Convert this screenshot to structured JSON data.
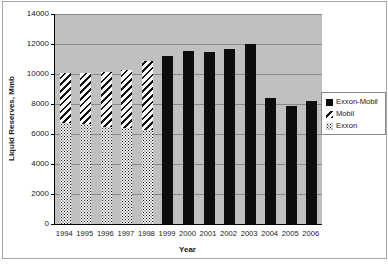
{
  "chart_data": {
    "type": "bar",
    "subtype": "stacked-and-single",
    "title": "",
    "xlabel": "Year",
    "ylabel": "Liquid Reserves, Mmb",
    "ylim": [
      0,
      14000
    ],
    "ytick_step": 2000,
    "yticks": [
      0,
      2000,
      4000,
      6000,
      8000,
      10000,
      12000,
      14000
    ],
    "grid": true,
    "plot_background": "#c0c0c0",
    "gridline_color": "#898989",
    "categories": [
      "1994",
      "1995",
      "1996",
      "1997",
      "1998",
      "1999",
      "2000",
      "2001",
      "2002",
      "2003",
      "2004",
      "2005",
      "2006"
    ],
    "series": [
      {
        "name": "Exxon",
        "pattern": "dots",
        "values": [
          6750,
          6650,
          6500,
          6400,
          6250,
          null,
          null,
          null,
          null,
          null,
          null,
          null,
          null
        ]
      },
      {
        "name": "Mobil",
        "pattern": "stripes",
        "values": [
          3300,
          3450,
          3650,
          3900,
          4650,
          null,
          null,
          null,
          null,
          null,
          null,
          null,
          null
        ]
      },
      {
        "name": "Exxon-Mobil",
        "pattern": "solid",
        "values": [
          null,
          null,
          null,
          null,
          null,
          11200,
          11550,
          11500,
          11700,
          12000,
          8400,
          7900,
          8200
        ]
      }
    ],
    "legend": {
      "position": "right",
      "entries": [
        "Exxon-Mobil",
        "Mobil",
        "Exxon"
      ]
    }
  },
  "colors": {
    "bar_black": "#0d0d0d",
    "frame_border": "#a8a8a8",
    "legend_border": "#8a8a8a",
    "text": "#1a1a1a"
  }
}
